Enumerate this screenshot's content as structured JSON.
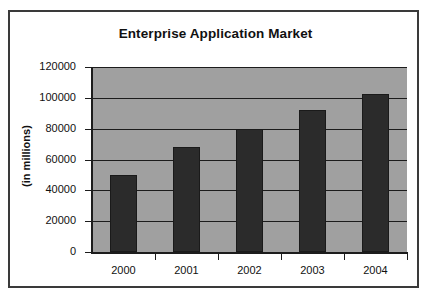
{
  "chart_data": {
    "type": "bar",
    "title": "Enterprise Application Market",
    "xlabel": "",
    "ylabel": "(in millions)",
    "categories": [
      "2000",
      "2001",
      "2002",
      "2003",
      "2004"
    ],
    "values": [
      50000,
      68000,
      80000,
      92000,
      102500
    ],
    "ylim": [
      0,
      120000
    ],
    "yticks": [
      0,
      20000,
      40000,
      60000,
      80000,
      100000,
      120000
    ],
    "ytick_labels": [
      "0",
      "20000",
      "40000",
      "60000",
      "80000",
      "100000",
      "120000"
    ],
    "grid": true,
    "legend": false,
    "series": [
      {
        "name": "Enterprise Application Market",
        "values": [
          50000,
          68000,
          80000,
          92000,
          102500
        ]
      }
    ],
    "colors": {
      "bar": "#2b2b2b",
      "plot_background": "#a0a0a0",
      "chart_background": "#ffffff",
      "axis": "#1c1c1c",
      "text": "#111111",
      "border": "#3a3a3a"
    }
  }
}
